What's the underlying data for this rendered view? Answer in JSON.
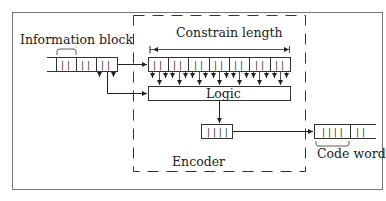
{
  "diagram": {
    "labels": {
      "information_block": "Information block",
      "constrain_length": "Constrain length",
      "logic": "Logic",
      "encoder": "Encoder",
      "code_word": "Code word"
    },
    "input_register": {
      "cells": [
        "| |",
        "| |",
        "| |"
      ]
    },
    "shift_register": {
      "cell_count": 7,
      "cells": [
        "| |",
        "| |",
        "| |",
        "| |",
        "| |",
        "| |",
        "| |"
      ]
    },
    "output_register": {
      "cells": [
        "| | | |"
      ]
    },
    "code_word_register": {
      "cells": [
        "| | | |",
        "| |"
      ]
    },
    "colors": {
      "line": "#333333",
      "frame": "#777777",
      "background": "#ffffff"
    }
  }
}
